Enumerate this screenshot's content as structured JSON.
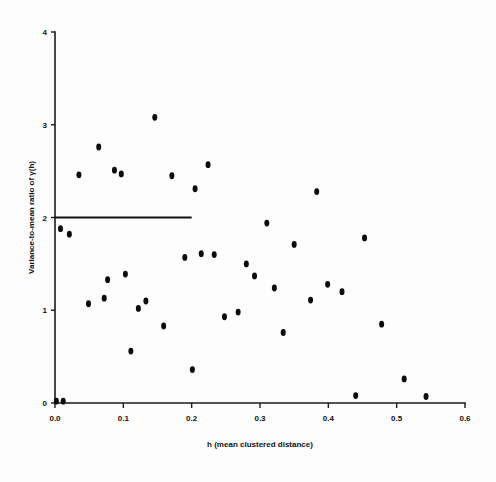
{
  "chart_data": {
    "type": "scatter",
    "title": "",
    "xlabel": "h (mean clustered distance)",
    "ylabel": "Variance-to-mean ratio of γ(h)",
    "xlim": [
      0.0,
      0.6
    ],
    "ylim": [
      0,
      4
    ],
    "xticks": [
      0.0,
      0.1,
      0.2,
      0.3,
      0.4,
      0.5,
      0.6
    ],
    "xticklabels": [
      "0.0",
      "0.1",
      "0.2",
      "0.3",
      "0.4",
      "0.5",
      "0.6"
    ],
    "yticks": [
      0,
      1,
      2,
      3,
      4
    ],
    "yticklabels": [
      "0",
      "1",
      "2",
      "3",
      "4"
    ],
    "grid": false,
    "legend": null,
    "marker": "filled-circle",
    "marker_color": "#0b0b0b",
    "points": [
      {
        "x": 0.002,
        "y": 0.02
      },
      {
        "x": 0.012,
        "y": 0.02
      },
      {
        "x": 0.008,
        "y": 1.88
      },
      {
        "x": 0.021,
        "y": 1.82
      },
      {
        "x": 0.035,
        "y": 2.46
      },
      {
        "x": 0.049,
        "y": 1.07
      },
      {
        "x": 0.064,
        "y": 2.76
      },
      {
        "x": 0.072,
        "y": 1.13
      },
      {
        "x": 0.077,
        "y": 1.33
      },
      {
        "x": 0.087,
        "y": 2.51
      },
      {
        "x": 0.097,
        "y": 2.47
      },
      {
        "x": 0.103,
        "y": 1.39
      },
      {
        "x": 0.111,
        "y": 0.56
      },
      {
        "x": 0.122,
        "y": 1.02
      },
      {
        "x": 0.133,
        "y": 1.1
      },
      {
        "x": 0.146,
        "y": 3.08
      },
      {
        "x": 0.159,
        "y": 0.83
      },
      {
        "x": 0.171,
        "y": 2.45
      },
      {
        "x": 0.19,
        "y": 1.57
      },
      {
        "x": 0.201,
        "y": 0.36
      },
      {
        "x": 0.205,
        "y": 2.31
      },
      {
        "x": 0.214,
        "y": 1.61
      },
      {
        "x": 0.224,
        "y": 2.57
      },
      {
        "x": 0.233,
        "y": 1.6
      },
      {
        "x": 0.248,
        "y": 0.93
      },
      {
        "x": 0.268,
        "y": 0.98
      },
      {
        "x": 0.28,
        "y": 1.5
      },
      {
        "x": 0.292,
        "y": 1.37
      },
      {
        "x": 0.31,
        "y": 1.94
      },
      {
        "x": 0.321,
        "y": 1.24
      },
      {
        "x": 0.334,
        "y": 0.76
      },
      {
        "x": 0.35,
        "y": 1.71
      },
      {
        "x": 0.374,
        "y": 1.11
      },
      {
        "x": 0.383,
        "y": 2.28
      },
      {
        "x": 0.399,
        "y": 1.28
      },
      {
        "x": 0.42,
        "y": 1.2
      },
      {
        "x": 0.44,
        "y": 0.08
      },
      {
        "x": 0.453,
        "y": 1.78
      },
      {
        "x": 0.478,
        "y": 0.85
      },
      {
        "x": 0.511,
        "y": 0.26
      },
      {
        "x": 0.543,
        "y": 0.07
      }
    ],
    "reference_line": {
      "orientation": "horizontal",
      "y": 2.0,
      "x_start": 0.0,
      "x_end": 0.2,
      "color": "#111111"
    }
  }
}
